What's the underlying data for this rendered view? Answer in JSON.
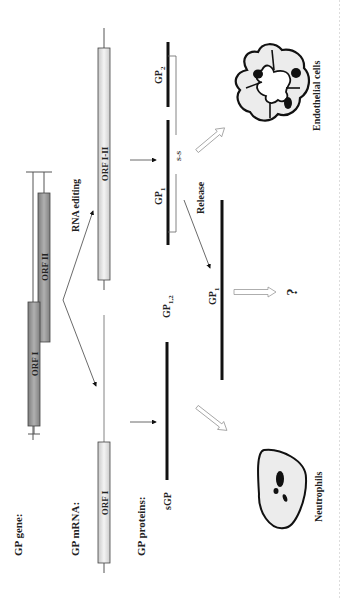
{
  "labels": {
    "gp_gene": "GP gene:",
    "gp_mrna": "GP mRNA:",
    "gp_proteins": "GP proteins:",
    "rna_editing": "RNA editing",
    "release": "Release",
    "ss": "S-S",
    "question": "?",
    "neutrophils": "Neutrophils",
    "endothelial_cells": "Endothelial cells"
  },
  "orfs": {
    "gene_orf1": "ORF I",
    "gene_orf2": "ORF II",
    "mrna_orf1": "ORF I",
    "mrna_orf12": "ORF I-II"
  },
  "proteins": {
    "sgp": "sGP",
    "gp12_main": "GP",
    "gp12_sub": "1,2",
    "gp1_main": "GP",
    "gp1_sub": "1",
    "gp2_main": "GP",
    "gp2_sub": "2",
    "gp1_released_main": "GP",
    "gp1_released_sub": "1"
  },
  "colors": {
    "orf_dark_fill": "#9a9a9a",
    "orf_light_fill": "#e2e2e2",
    "cell_fill": "#ececec",
    "ink": "#111111"
  }
}
